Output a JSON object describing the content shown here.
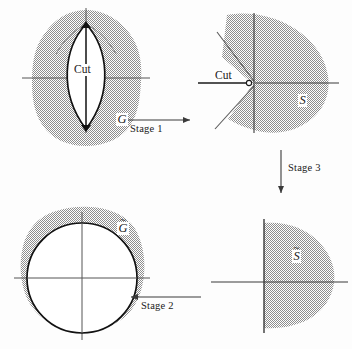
{
  "figure": {
    "background_color": "#fdfdfd",
    "shade_color": "#b3b3b3",
    "line_color": "#3a3a3a",
    "curve_color": "#111111",
    "panels": {
      "top_left": {
        "region_label": "G",
        "cut_label": "Cut",
        "description": "domain G with a slit cut, lens-shaped opening"
      },
      "top_right": {
        "region_label": "S",
        "cut_label": "Cut",
        "description": "domain S with V shaped notch opened at origin"
      },
      "bottom_left": {
        "region_label": "G",
        "region_label_accent": "~",
        "description": "domain G-tilde containing unit circle"
      },
      "bottom_right": {
        "region_label": "S",
        "region_label_accent": "~",
        "description": "domain S-tilde half plane region"
      }
    },
    "arrows": [
      {
        "id": "stage-1",
        "label": "Stage 1",
        "direction": "right"
      },
      {
        "id": "stage-3",
        "label": "Stage 3",
        "direction": "down"
      },
      {
        "id": "stage-2",
        "label": "Stage 2",
        "direction": "left"
      }
    ]
  }
}
